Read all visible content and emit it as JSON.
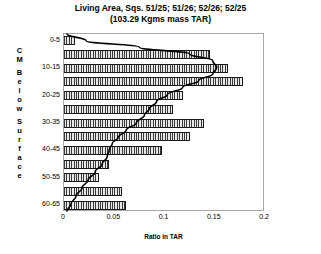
{
  "chart_data": {
    "type": "bar",
    "orientation": "horizontal",
    "title": "Living Area, Sqs. 51/25; 51/26; 52/26; 52/25 (103.29 Kgms mass TAR)",
    "title_lines": [
      "Living Area, Sqs. 51/25; 51/26; 52/26; 52/25",
      "(103.29 Kgms mass TAR)"
    ],
    "xlabel": "Ratio in TAR",
    "ylabel": "CM Below Surface",
    "ylabel_letters": [
      "C",
      "M",
      "",
      "B",
      "e",
      "l",
      "o",
      "w",
      "",
      "S",
      "u",
      "r",
      "f",
      "a",
      "c",
      "e"
    ],
    "xlim": [
      0,
      0.2
    ],
    "xticks": [
      0,
      0.05,
      0.1,
      0.15,
      0.2
    ],
    "xtick_labels": [
      "0",
      "0.05",
      "0.1",
      "0.15",
      "0.2"
    ],
    "grid": false,
    "legend": false,
    "categories": [
      "0-5",
      "5-10",
      "10-15",
      "15-20",
      "20-25",
      "25-30",
      "30-35",
      "35-40",
      "40-45",
      "45-50",
      "50-55",
      "55-60",
      "60-65"
    ],
    "visible_tick_labels": [
      "0-5",
      "10-15",
      "20-25",
      "30-35",
      "40-45",
      "50-55",
      "60-65"
    ],
    "values": [
      0.011,
      0.145,
      0.163,
      0.178,
      0.118,
      0.108,
      0.139,
      0.125,
      0.098,
      0.045,
      0.035,
      0.058,
      0.062
    ],
    "series_name": "Ratio in TAR",
    "overlay_curve": {
      "name": "cumulative-trend",
      "points": [
        [
          0.003,
          0.0
        ],
        [
          0.022,
          0.038
        ],
        [
          0.075,
          0.075
        ],
        [
          0.125,
          0.112
        ],
        [
          0.148,
          0.15
        ],
        [
          0.152,
          0.188
        ],
        [
          0.148,
          0.225
        ],
        [
          0.134,
          0.262
        ],
        [
          0.118,
          0.3
        ],
        [
          0.103,
          0.34
        ],
        [
          0.092,
          0.38
        ],
        [
          0.085,
          0.42
        ],
        [
          0.08,
          0.455
        ],
        [
          0.072,
          0.5
        ],
        [
          0.062,
          0.54
        ],
        [
          0.054,
          0.58
        ],
        [
          0.048,
          0.615
        ],
        [
          0.045,
          0.65
        ],
        [
          0.043,
          0.69
        ],
        [
          0.038,
          0.73
        ],
        [
          0.031,
          0.775
        ],
        [
          0.024,
          0.82
        ],
        [
          0.018,
          0.865
        ],
        [
          0.012,
          0.91
        ],
        [
          0.007,
          0.955
        ],
        [
          0.003,
          0.995
        ]
      ]
    },
    "colors": {
      "bar_fill": "#8c8c8c",
      "bar_hatch": "#3a3a3a",
      "bar_border": "#1a1a1a",
      "curve": "#000000",
      "frame": "#a8a8a8",
      "background": "#ffffff"
    }
  }
}
